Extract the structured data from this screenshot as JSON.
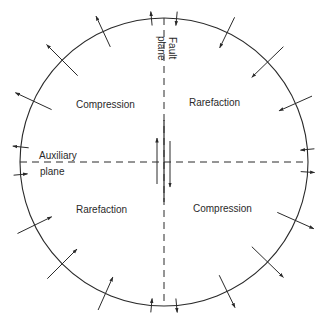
{
  "diagram": {
    "type": "focal-mechanism (beach ball) first-motion diagram",
    "circle": {
      "cx": 164,
      "cy": 162,
      "r": 144,
      "stroke": "#2a2a2a"
    },
    "fault_plane": {
      "label_line1": "Fault",
      "label_line2": "plane",
      "orientation": "vertical",
      "style": "dashed"
    },
    "auxiliary_plane": {
      "label_line1": "Auxiliary",
      "label_line2": "plane",
      "orientation": "horizontal",
      "style": "dashed"
    },
    "quadrants": [
      {
        "position": "upper-left",
        "label": "Compression",
        "arrow_direction": "outward"
      },
      {
        "position": "upper-right",
        "label": "Rarefaction",
        "arrow_direction": "inward"
      },
      {
        "position": "lower-left",
        "label": "Rarefaction",
        "arrow_direction": "inward"
      },
      {
        "position": "lower-right",
        "label": "Compression",
        "arrow_direction": "outward"
      }
    ],
    "center_slip": {
      "left_arrow": "up",
      "right_arrow": "down"
    },
    "first_motion_arrows": [
      {
        "angle_deg": -95,
        "length": 14,
        "direction": "out"
      },
      {
        "angle_deg": -115,
        "length": 34,
        "direction": "out"
      },
      {
        "angle_deg": -135,
        "length": 44,
        "direction": "out"
      },
      {
        "angle_deg": -155,
        "length": 40,
        "direction": "out"
      },
      {
        "angle_deg": -174,
        "length": 16,
        "direction": "out"
      },
      {
        "angle_deg": -85,
        "length": 14,
        "direction": "in"
      },
      {
        "angle_deg": -64,
        "length": 34,
        "direction": "in"
      },
      {
        "angle_deg": -44,
        "length": 44,
        "direction": "in"
      },
      {
        "angle_deg": -24,
        "length": 36,
        "direction": "in"
      },
      {
        "angle_deg": -5,
        "length": 14,
        "direction": "in"
      },
      {
        "angle_deg": 175,
        "length": 14,
        "direction": "in"
      },
      {
        "angle_deg": 154,
        "length": 38,
        "direction": "in"
      },
      {
        "angle_deg": 135,
        "length": 42,
        "direction": "in"
      },
      {
        "angle_deg": 114,
        "length": 36,
        "direction": "in"
      },
      {
        "angle_deg": 95,
        "length": 14,
        "direction": "in"
      },
      {
        "angle_deg": 85,
        "length": 14,
        "direction": "out"
      },
      {
        "angle_deg": 64,
        "length": 36,
        "direction": "out"
      },
      {
        "angle_deg": 44,
        "length": 44,
        "direction": "out"
      },
      {
        "angle_deg": 24,
        "length": 40,
        "direction": "out"
      },
      {
        "angle_deg": 4,
        "length": 14,
        "direction": "out"
      }
    ]
  }
}
